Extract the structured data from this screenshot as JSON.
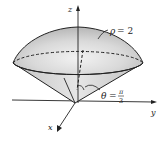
{
  "figure": {
    "axes": {
      "x_label": "x",
      "y_label": "y",
      "z_label": "z"
    },
    "annotations": {
      "sphere_label": "ρ = 2",
      "sphere_rho": "ρ",
      "sphere_eq": "= 2",
      "angle_symbol": "θ",
      "angle_eq": "=",
      "angle_num": "π",
      "angle_den": "3"
    },
    "colors": {
      "stroke": "#222222",
      "fill_light": "#e8e8e8",
      "fill_mid": "#cfcfcf",
      "fill_dark": "#b5b5b5"
    }
  }
}
